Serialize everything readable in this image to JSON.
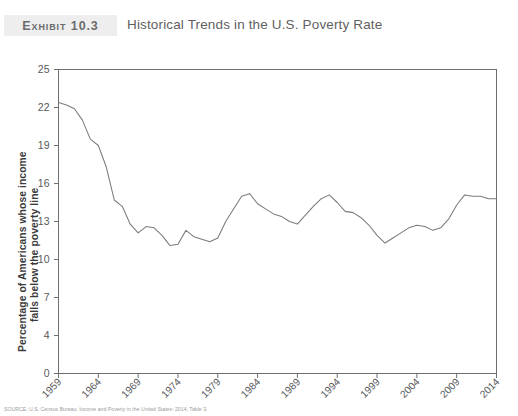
{
  "header": {
    "exhibit_label": "Exhibit 10.3",
    "title": "Historical Trends in the U.S. Poverty Rate"
  },
  "source": {
    "text": "SOURCE: U.S. Census Bureau, Income and Poverty in the United States: 2014, Table 3."
  },
  "chart_data": {
    "type": "line",
    "title": "Historical Trends in the U.S. Poverty Rate",
    "xlabel": "",
    "ylabel": "Percentage of Americans whose income falls below the poverty line",
    "ylabel_line1": "Percentage of Americans whose income",
    "ylabel_line2": "falls below the poverty line",
    "xlim": [
      1959,
      2014
    ],
    "ylim": [
      0,
      25
    ],
    "grid": false,
    "legend": null,
    "line_color": "#7b7b7b",
    "axis_color": "#6e6e6e",
    "ytick_labels": [
      "25",
      "22",
      "19",
      "16",
      "13",
      "10",
      "7",
      "4",
      "0"
    ],
    "ytick_values": [
      25,
      22,
      19,
      16,
      13,
      10,
      7,
      4,
      0
    ],
    "xtick_labels": [
      "1959",
      "1964",
      "1969",
      "1974",
      "1979",
      "1984",
      "1989",
      "1994",
      "1999",
      "2004",
      "2009",
      "2014"
    ],
    "xtick_values": [
      1959,
      1964,
      1969,
      1974,
      1979,
      1984,
      1989,
      1994,
      1999,
      2004,
      2009,
      2014
    ],
    "x": [
      1959,
      1960,
      1961,
      1962,
      1963,
      1964,
      1965,
      1966,
      1967,
      1968,
      1969,
      1970,
      1971,
      1972,
      1973,
      1974,
      1975,
      1976,
      1977,
      1978,
      1979,
      1980,
      1981,
      1982,
      1983,
      1984,
      1985,
      1986,
      1987,
      1988,
      1989,
      1990,
      1991,
      1992,
      1993,
      1994,
      1995,
      1996,
      1997,
      1998,
      1999,
      2000,
      2001,
      2002,
      2003,
      2004,
      2005,
      2006,
      2007,
      2008,
      2009,
      2010,
      2011,
      2012,
      2013,
      2014
    ],
    "values": [
      22.4,
      22.2,
      21.9,
      21.0,
      19.5,
      19.0,
      17.3,
      14.7,
      14.2,
      12.8,
      12.1,
      12.6,
      12.5,
      11.9,
      11.1,
      11.2,
      12.3,
      11.8,
      11.6,
      11.4,
      11.7,
      13.0,
      14.0,
      15.0,
      15.2,
      14.4,
      14.0,
      13.6,
      13.4,
      13.0,
      12.8,
      13.5,
      14.2,
      14.8,
      15.1,
      14.5,
      13.8,
      13.7,
      13.3,
      12.7,
      11.9,
      11.3,
      11.7,
      12.1,
      12.5,
      12.7,
      12.6,
      12.3,
      12.5,
      13.2,
      14.3,
      15.1,
      15.0,
      15.0,
      14.8,
      14.8
    ],
    "notable_points": {
      "start_1959": 22.4,
      "min_1973": 11.1,
      "peak_1983": 15.2,
      "peak_1993": 15.1,
      "low_2000": 11.3,
      "peak_2010": 15.1,
      "end_2014": 14.8
    }
  }
}
